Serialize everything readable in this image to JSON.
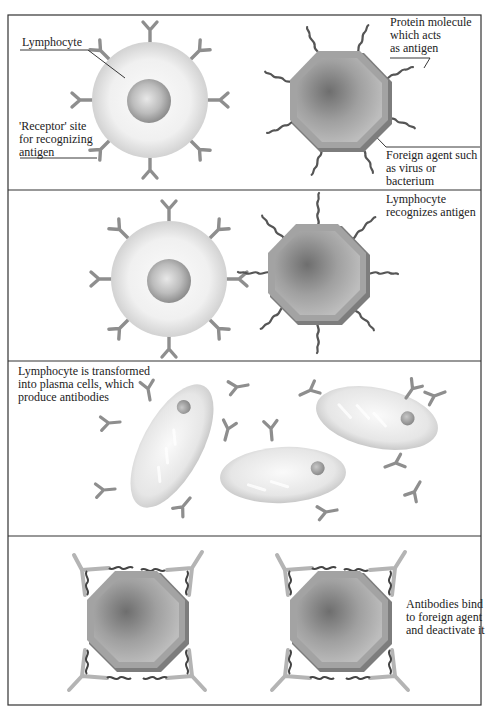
{
  "figure": {
    "panels": [
      {
        "id": "panel-1",
        "labels": {
          "lymphocyte": "Lymphocyte",
          "receptor": "'Receptor' site\nfor recognizing\nantigen",
          "protein": "Protein molecule\nwhich acts\nas antigen",
          "foreign_agent": "Foreign agent such\nas virus or\nbacterium"
        }
      },
      {
        "id": "panel-2",
        "labels": {
          "caption": "Lymphocyte\nrecognizes antigen"
        }
      },
      {
        "id": "panel-3",
        "labels": {
          "caption": "Lymphocyte is transformed\ninto plasma cells, which\nproduce antibodies"
        }
      },
      {
        "id": "panel-4",
        "labels": {
          "caption": "Antibodies bind\nto foreign agent\nand deactivate it"
        }
      }
    ],
    "colors": {
      "frame": "#333333",
      "receptor": "#8e8e8e",
      "lymphocyte_fill": "#ececec",
      "nucleus_fill": "#b8b8b8",
      "antigen_body": "#9a9a9a",
      "antigen_rim": "#7a7a7a",
      "antigen_tail": "#555555",
      "plasma_cell_fill": "#e6e6e6"
    }
  }
}
